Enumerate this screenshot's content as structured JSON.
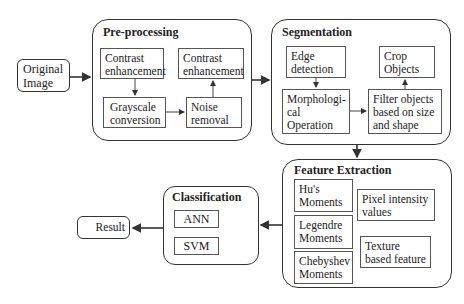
{
  "input": {
    "label_line1": "Original",
    "label_line2": "Image"
  },
  "preprocessing": {
    "title": "Pre-processing",
    "steps": [
      {
        "line1": "Contrast",
        "line2": "enhancement"
      },
      {
        "line1": "Grayscale",
        "line2": "conversion"
      },
      {
        "line1": "Noise",
        "line2": "removal"
      },
      {
        "line1": "Contrast",
        "line2": "enhancement"
      }
    ]
  },
  "segmentation": {
    "title": "Segmentation",
    "steps": [
      {
        "line1": "Edge",
        "line2": "detection"
      },
      {
        "line1": "Morphologi-",
        "line2": "cal",
        "line3": "Operation"
      },
      {
        "line1": "Filter objects",
        "line2": "based on size",
        "line3": "and shape"
      },
      {
        "line1": "Crop",
        "line2": "Objects"
      }
    ]
  },
  "feature_extraction": {
    "title": "Feature Extraction",
    "items": [
      {
        "line1": "Hu's",
        "line2": "Moments"
      },
      {
        "line1": "Legendre",
        "line2": "Moments"
      },
      {
        "line1": "Chebyshev",
        "line2": "Moments"
      },
      {
        "line1": "Pixel intensity",
        "line2": "values"
      },
      {
        "line1": "Texture",
        "line2": "based feature"
      }
    ]
  },
  "classification": {
    "title": "Classification",
    "methods": [
      "ANN",
      "SVM"
    ]
  },
  "output": {
    "label": "Result"
  }
}
